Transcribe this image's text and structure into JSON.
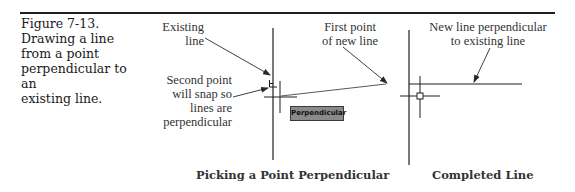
{
  "figure": {
    "number": "Figure 7-13.",
    "caption_lines": [
      "Drawing a line",
      "from a point",
      "perpendicular to an",
      "existing line."
    ]
  },
  "left_panel": {
    "callouts": {
      "existing_line": [
        "Existing",
        "line"
      ],
      "second_point": [
        "Second point",
        "will snap so",
        "lines are",
        "perpendicular"
      ],
      "first_point": [
        "First point",
        "of new line"
      ]
    },
    "tooltip": "Perpendicular",
    "subcaption": "Picking a Point Perpendicular",
    "icons": [
      "perpendicular-snap-icon",
      "crosshair-cursor-icon"
    ]
  },
  "right_panel": {
    "callouts": {
      "new_line": [
        "New line perpendicular",
        "to existing line"
      ]
    },
    "subcaption": "Completed Line",
    "icons": [
      "crosshair-cursor-icon",
      "pickbox-icon"
    ]
  },
  "colors": {
    "line": "#1e1e1e",
    "text": "#333333",
    "tooltip_bg": "#8a8a8a"
  }
}
